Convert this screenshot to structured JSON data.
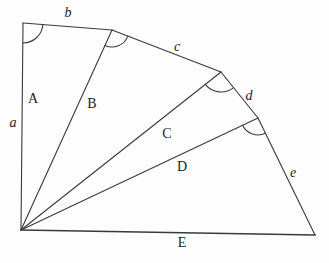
{
  "colors": {
    "background": "#fdfdfd",
    "line": "#3a3a3a",
    "text": "#1c1c1c"
  },
  "labels": {
    "a": "a",
    "b": "b",
    "c": "c",
    "d": "d",
    "e": "e",
    "A": "A",
    "B": "B",
    "C": "C",
    "D": "D",
    "E": "E"
  }
}
